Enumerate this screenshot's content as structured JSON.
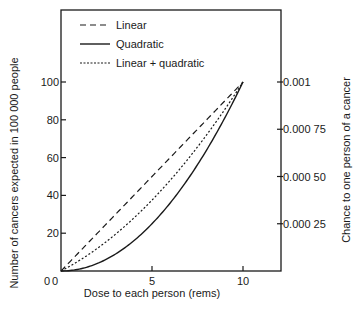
{
  "chart_data": {
    "type": "line",
    "title": "",
    "xlabel": "Dose to each person (rems)",
    "ylabel": "Number of cancers expected in 100 000 people",
    "y2label": "Chance to one person of a cancer",
    "xlim": [
      0,
      10.6
    ],
    "ylim": [
      0,
      138
    ],
    "x_ticks": [
      0,
      5,
      10
    ],
    "x_tick_labels": [
      "0",
      "5",
      "10"
    ],
    "y_ticks": [
      0,
      20,
      40,
      60,
      80,
      100
    ],
    "y_tick_labels": [
      "0",
      "20",
      "40",
      "60",
      "80",
      "100"
    ],
    "y2_ticks": [
      25,
      50,
      75,
      100
    ],
    "y2_tick_labels": [
      "0.000 25",
      "0.000 50",
      "0.000 75",
      "0.001"
    ],
    "grid": false,
    "legend_position": "upper left",
    "x": [
      0,
      1,
      2,
      3,
      4,
      5,
      6,
      7,
      8,
      9,
      10
    ],
    "series": [
      {
        "name": "Linear",
        "style": "dashed",
        "values": [
          0,
          10,
          20,
          30,
          40,
          50,
          60,
          70,
          80,
          90,
          100
        ]
      },
      {
        "name": "Quadratic",
        "style": "solid",
        "values": [
          0,
          1,
          4,
          9,
          16,
          25,
          36,
          49,
          64,
          81,
          100
        ]
      },
      {
        "name": "Linear + quadratic",
        "style": "dotted",
        "values": [
          0,
          5.5,
          12,
          19.5,
          28,
          37.5,
          48,
          59.5,
          72,
          85.5,
          100
        ]
      }
    ]
  },
  "legend": {
    "items": [
      {
        "label": "Linear",
        "style": "dashed"
      },
      {
        "label": "Quadratic",
        "style": "solid"
      },
      {
        "label": "Linear + quadratic",
        "style": "dotted"
      }
    ]
  },
  "colors": {
    "ink": "#1a1a1a",
    "background": "#ffffff"
  }
}
